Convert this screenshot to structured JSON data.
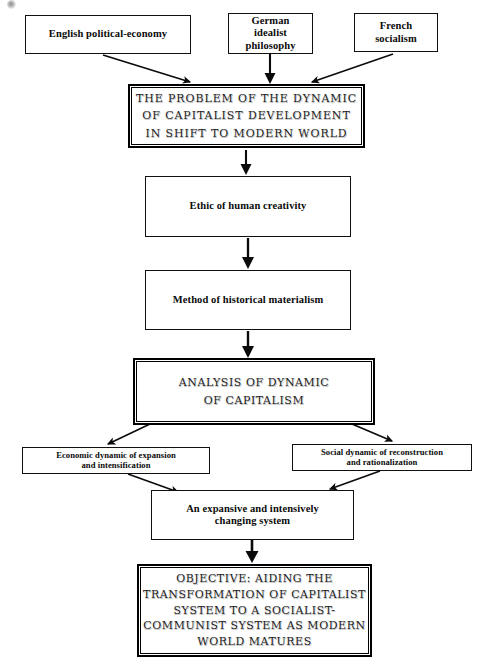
{
  "diagram": {
    "colors": {
      "background": "#ffffff",
      "ink": "#101010",
      "emphasis_ink": "#1b1b1b"
    },
    "sources": [
      {
        "id": "english",
        "label": "English political-economy"
      },
      {
        "id": "german",
        "label": "German\nidealist\nphilosophy"
      },
      {
        "id": "french",
        "label": "French\nsocialism"
      }
    ],
    "nodes": [
      {
        "id": "problem",
        "label": "THE PROBLEM OF THE DYNAMIC\nOF CAPITALIST DEVELOPMENT\nIN SHIFT TO MODERN WORLD",
        "emphasis": true
      },
      {
        "id": "ethic",
        "label": "Ethic of human creativity",
        "emphasis": false
      },
      {
        "id": "method",
        "label": "Method of historical materialism",
        "emphasis": false
      },
      {
        "id": "analysis",
        "label": "ANALYSIS OF DYNAMIC\nOF CAPITALISM",
        "emphasis": true
      },
      {
        "id": "economic",
        "label": "Economic dynamic of expansion\nand intensification",
        "emphasis": false
      },
      {
        "id": "social",
        "label": "Social dynamic of reconstruction\nand rationalization",
        "emphasis": false
      },
      {
        "id": "system",
        "label": "An expansive and intensively\nchanging system",
        "emphasis": false
      },
      {
        "id": "objective",
        "label": "OBJECTIVE: AIDING THE\nTRANSFORMATION OF CAPITALIST\nSYSTEM TO A SOCIALIST-\nCOMMUNIST SYSTEM AS MODERN\nWORLD MATURES",
        "emphasis": true
      }
    ],
    "edges": [
      {
        "from": "english",
        "to": "problem",
        "style": "diagonal-arrow"
      },
      {
        "from": "german",
        "to": "problem",
        "style": "vertical-arrow"
      },
      {
        "from": "french",
        "to": "problem",
        "style": "diagonal-arrow"
      },
      {
        "from": "problem",
        "to": "ethic",
        "style": "vertical-arrow"
      },
      {
        "from": "ethic",
        "to": "method",
        "style": "vertical-arrow"
      },
      {
        "from": "method",
        "to": "analysis",
        "style": "vertical-arrow"
      },
      {
        "from": "analysis",
        "to": "economic",
        "style": "diagonal-arrow"
      },
      {
        "from": "analysis",
        "to": "social",
        "style": "diagonal-arrow"
      },
      {
        "from": "economic",
        "to": "system",
        "style": "diagonal-arrow"
      },
      {
        "from": "social",
        "to": "system",
        "style": "diagonal-arrow"
      },
      {
        "from": "system",
        "to": "objective",
        "style": "vertical-arrow"
      }
    ]
  }
}
